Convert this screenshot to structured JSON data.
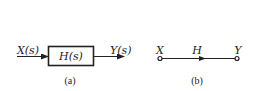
{
  "block_diagram": {
    "input_label": "X(s)",
    "block_label": "H(s)",
    "output_label": "Y(s)",
    "caption": "(a)"
  },
  "signal_flow_graph": {
    "input_node_label": "X",
    "branch_label": "H",
    "output_node_label": "Y",
    "caption": "(b)"
  },
  "colors": {
    "stroke": "#222222",
    "background": "#ffffff"
  }
}
